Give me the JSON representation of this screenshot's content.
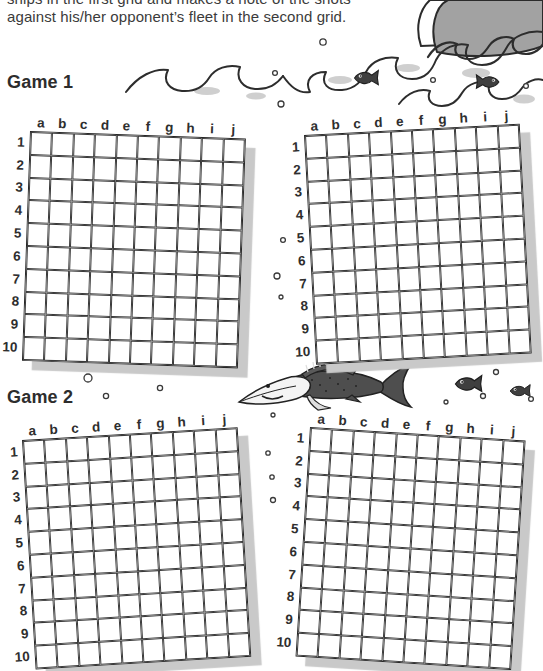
{
  "page": {
    "intro_line1": "ships in the first grid and makes a note of the shots",
    "intro_line2": "against his/her opponent’s fleet in the second grid.",
    "game1_label": "Game 1",
    "game2_label": "Game 2"
  },
  "grids": {
    "size": "10x10",
    "column_labels": [
      "a",
      "b",
      "c",
      "d",
      "e",
      "f",
      "g",
      "h",
      "i",
      "j"
    ],
    "row_labels": [
      "1",
      "2",
      "3",
      "4",
      "5",
      "6",
      "7",
      "8",
      "9",
      "10"
    ],
    "instances": [
      {
        "name": "game1-grid-left"
      },
      {
        "name": "game1-grid-right"
      },
      {
        "name": "game2-grid-left"
      },
      {
        "name": "game2-grid-right"
      }
    ]
  },
  "illustrations": {
    "ship": "cartoon-steamship-icon",
    "waves": "sea-waves-icon",
    "big_fish": "swordfish-icon",
    "small_fish": "fish-icon",
    "bubbles": "air-bubbles-icon"
  },
  "colors": {
    "ink": "#2d2d2d",
    "grid_line": "#3a3a3a",
    "shadow": "#c9c9c9",
    "ship_gray": "#a2a2a2",
    "dark_gray": "#3b3b3b",
    "paper": "#ffffff"
  }
}
